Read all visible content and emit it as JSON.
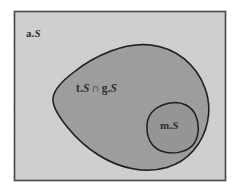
{
  "figure": {
    "kind": "euler-set-diagram",
    "caption": "",
    "background_color": "#ffffff"
  },
  "universe": {
    "name": "universe-rectangle",
    "label_prefix": "a.",
    "label_symbol": "S",
    "label_full": "a.S",
    "fill_color": "#e7e7e7",
    "stroke_color": "#8c8c8c"
  },
  "outer_set": {
    "name": "intersection-blob",
    "label_left_prefix": "t.",
    "label_left_symbol": "S",
    "label_operator": "∩",
    "label_right_prefix": "g.",
    "label_right_symbol": "S",
    "label_full": "t.S ∩ g.S",
    "fill_color": "#c9c9c9",
    "stroke_color": "#5a5a5a"
  },
  "inner_set": {
    "name": "inner-blob",
    "label_prefix": "m.",
    "label_symbol": "S",
    "label_full": "m.S",
    "fill_color": "#c4c4c4",
    "stroke_color": "#5a5a5a"
  }
}
